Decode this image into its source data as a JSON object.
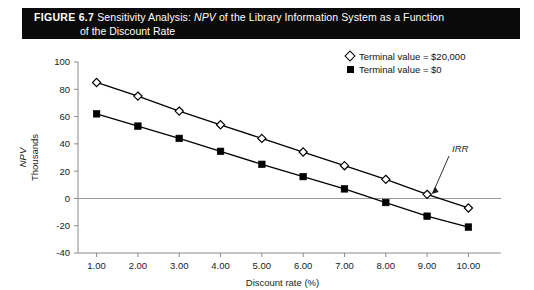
{
  "caption": {
    "figure_number": "FIGURE 6.7",
    "line1_pre": "Sensitivity Analysis:",
    "line1_italic": "NPV",
    "line1_post": "of the Library Information System as a Function",
    "line2": "of the Discount Rate"
  },
  "legend": {
    "position": "top-right",
    "entries": [
      {
        "marker": "open-diamond",
        "label": "Terminal value = $20,000"
      },
      {
        "marker": "filled-square",
        "label": "Terminal value = $0"
      }
    ]
  },
  "annotations": [
    {
      "name": "irr-label",
      "text": "IRR",
      "x": 9.0,
      "y": 0
    }
  ],
  "colors": {
    "series_line": "#000000",
    "zero_line": "#9a9a9a",
    "axis": "#8a8a8a",
    "caption_bg": "#0a0a0a",
    "caption_fg": "#ffffff",
    "text": "#1a1a1a"
  },
  "chart_data": {
    "type": "line",
    "title": "Sensitivity Analysis: NPV of the Library Information System as a Function of the Discount Rate",
    "xlabel": "Discount rate (%)",
    "ylabel": "NPV Thousands",
    "ylabel_italic_part": "NPV",
    "ylabel_plain_part": "Thousands",
    "x": [
      1.0,
      2.0,
      3.0,
      4.0,
      5.0,
      6.0,
      7.0,
      8.0,
      9.0,
      10.0
    ],
    "xticklabels": [
      "1.00",
      "2.00",
      "3.00",
      "4.00",
      "5.00",
      "6.00",
      "7.00",
      "8.00",
      "9.00",
      "10.00"
    ],
    "yticks": [
      -40,
      -20,
      0,
      20,
      40,
      60,
      80,
      100
    ],
    "yticklabels": [
      "-40",
      "-20",
      "0",
      "20",
      "40",
      "60",
      "80",
      "100"
    ],
    "xlim": [
      0.55,
      10.45
    ],
    "ylim": [
      -40,
      100
    ],
    "grid": false,
    "zero_line": true,
    "legend_position": "top-right",
    "series": [
      {
        "name": "Terminal value = $20,000",
        "marker": "open-diamond",
        "values": [
          85,
          75,
          64,
          54,
          44,
          34,
          24,
          14,
          3,
          -7
        ]
      },
      {
        "name": "Terminal value = $0",
        "marker": "filled-square",
        "values": [
          62,
          53,
          44,
          34.5,
          25,
          16,
          7,
          -3,
          -13,
          -21
        ]
      }
    ]
  }
}
